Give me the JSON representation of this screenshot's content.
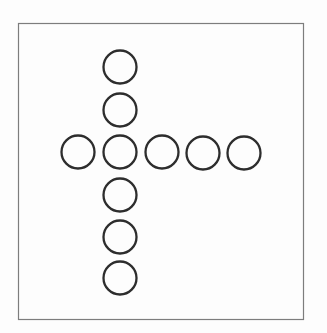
{
  "figure": {
    "background_color": "#fdfdfd",
    "frame": {
      "x": 18.5,
      "y": 23.5,
      "width": 285,
      "height": 296,
      "stroke": "#7d7d7d",
      "stroke_width": 1.2,
      "fill": "#fdfdfd"
    },
    "circles": {
      "radius": 16.5,
      "stroke": "#2d2d2d",
      "stroke_width": 2.3,
      "fill": "#fdfdfd",
      "count": 10,
      "vertical_arm_count": 6,
      "horizontal_arm_count": 5,
      "centers": [
        {
          "x": 120,
          "y": 67
        },
        {
          "x": 120,
          "y": 110
        },
        {
          "x": 78,
          "y": 152
        },
        {
          "x": 120,
          "y": 152
        },
        {
          "x": 162,
          "y": 152
        },
        {
          "x": 203,
          "y": 153
        },
        {
          "x": 244,
          "y": 153
        },
        {
          "x": 120,
          "y": 195
        },
        {
          "x": 120,
          "y": 237
        },
        {
          "x": 120,
          "y": 278
        }
      ]
    }
  }
}
